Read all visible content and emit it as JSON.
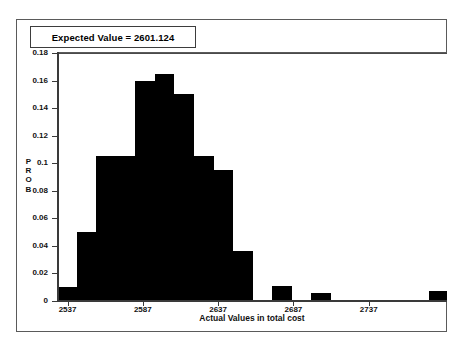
{
  "figure": {
    "expected_value_label": "Expected Value = 2601.124"
  },
  "axis": {
    "y_title_letters": [
      "P",
      "R",
      "O",
      "B"
    ],
    "x_title": "Actual Values in total cost",
    "y_ticks": [
      "0",
      "0.02",
      "0.04",
      "0.06",
      "0.08",
      "0.1",
      "0.12",
      "0.14",
      "0.16",
      "0.18"
    ],
    "x_ticks": [
      "2537",
      "2587",
      "2637",
      "2687",
      "2737"
    ]
  },
  "colors": {
    "bar_fill": "#000000",
    "axis": "#3a3a3a",
    "grid": "#8d8d8d",
    "frame": "#5a5a5a",
    "text": "#111111",
    "background": "#ffffff"
  },
  "chart_data": {
    "type": "bar",
    "title": "Expected Value = 2601.124",
    "xlabel": "Actual Values in total cost",
    "ylabel": "PROB",
    "xlim": [
      2530,
      2789
    ],
    "ylim": [
      0,
      0.18
    ],
    "grid": true,
    "legend": null,
    "bin_width": 10,
    "x_tick_values": [
      2537,
      2587,
      2637,
      2687,
      2737
    ],
    "y_tick_values": [
      0,
      0.02,
      0.04,
      0.06,
      0.08,
      0.1,
      0.12,
      0.14,
      0.16,
      0.18
    ],
    "bins": [
      {
        "x_start": 2530,
        "x_end": 2543,
        "value": 0.01
      },
      {
        "x_start": 2543,
        "x_end": 2556,
        "value": 0.05
      },
      {
        "x_start": 2556,
        "x_end": 2569,
        "value": 0.105
      },
      {
        "x_start": 2569,
        "x_end": 2582,
        "value": 0.105
      },
      {
        "x_start": 2582,
        "x_end": 2595,
        "value": 0.16
      },
      {
        "x_start": 2595,
        "x_end": 2608,
        "value": 0.165
      },
      {
        "x_start": 2608,
        "x_end": 2621,
        "value": 0.15
      },
      {
        "x_start": 2621,
        "x_end": 2634,
        "value": 0.105
      },
      {
        "x_start": 2634,
        "x_end": 2647,
        "value": 0.095
      },
      {
        "x_start": 2647,
        "x_end": 2660,
        "value": 0.036
      },
      {
        "x_start": 2660,
        "x_end": 2673,
        "value": 0.0
      },
      {
        "x_start": 2673,
        "x_end": 2686,
        "value": 0.011
      },
      {
        "x_start": 2686,
        "x_end": 2699,
        "value": 0.0
      },
      {
        "x_start": 2699,
        "x_end": 2712,
        "value": 0.006
      },
      {
        "x_start": 2712,
        "x_end": 2725,
        "value": 0.0
      },
      {
        "x_start": 2725,
        "x_end": 2738,
        "value": 0.0
      },
      {
        "x_start": 2738,
        "x_end": 2751,
        "value": 0.0
      },
      {
        "x_start": 2751,
        "x_end": 2764,
        "value": 0.0
      },
      {
        "x_start": 2764,
        "x_end": 2777,
        "value": 0.0
      },
      {
        "x_start": 2777,
        "x_end": 2789,
        "value": 0.007
      }
    ]
  }
}
